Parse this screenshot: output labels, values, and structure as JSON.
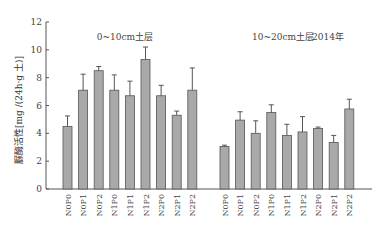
{
  "chart_data": {
    "type": "bar",
    "title": "",
    "xlabel": "",
    "ylabel": "脲酶活性[mg /(24h·g 土)]",
    "ylim": [
      0,
      12
    ],
    "yticks": [
      0,
      2,
      4,
      6,
      8,
      10,
      12
    ],
    "grid": false,
    "legend": null,
    "annotations": [
      "0~10cm土层",
      "10~20cm土层",
      "2014年"
    ],
    "groups": [
      {
        "name": "0~10cm土层",
        "categories": [
          "N0P0",
          "N0P1",
          "N0P2",
          "N1P0",
          "N1P1",
          "N1P2",
          "N2P0",
          "N2P1",
          "N2P2"
        ],
        "values": [
          4.5,
          7.1,
          8.5,
          7.1,
          6.7,
          9.3,
          6.7,
          5.3,
          7.1
        ],
        "error_upper": [
          5.25,
          8.25,
          8.8,
          8.2,
          7.75,
          10.2,
          7.45,
          5.6,
          8.7
        ]
      },
      {
        "name": "10~20cm土层",
        "categories": [
          "N0P0",
          "N0P1",
          "N0P2",
          "N1P0",
          "N1P1",
          "N1P2",
          "N2P0",
          "N2P1",
          "N2P2"
        ],
        "values": [
          3.05,
          4.95,
          4.0,
          5.5,
          3.85,
          4.1,
          4.35,
          3.35,
          5.75
        ],
        "error_upper": [
          3.15,
          5.55,
          4.9,
          6.05,
          4.65,
          5.2,
          4.45,
          3.85,
          6.45
        ]
      }
    ],
    "colors": {
      "bar_fill": "#a9a9a9",
      "bar_stroke": "#555555",
      "error_bar": "#555555",
      "axis": "#555555"
    }
  },
  "labels": {
    "panel1_title": "0~10cm土层",
    "panel2_title": "10~20cm土层",
    "year": "2014年",
    "ylabel": "脲酶活性[mg /(24h·g 土)]"
  }
}
